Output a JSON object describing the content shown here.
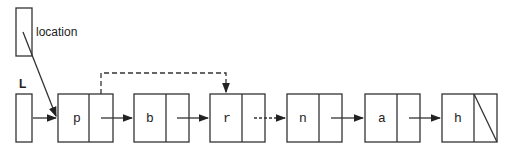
{
  "pointers": {
    "location": "location",
    "head": "L"
  },
  "nodes": [
    {
      "value": "p",
      "x": 58
    },
    {
      "value": "b",
      "x": 134
    },
    {
      "value": "r",
      "x": 210
    },
    {
      "value": "n",
      "x": 287
    },
    {
      "value": "a",
      "x": 365
    },
    {
      "value": "h",
      "x": 442
    }
  ],
  "colors": {
    "stroke": "#333333"
  }
}
